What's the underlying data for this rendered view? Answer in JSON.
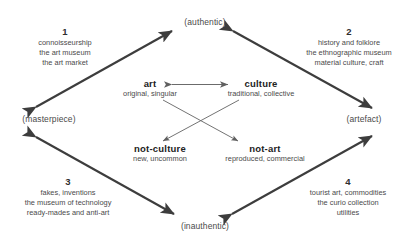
{
  "diagram": {
    "colors": {
      "outer_arrow": "#3d3d3d",
      "inner_arrow": "#6b6b6b",
      "text": "#4a4a4a",
      "heading_text": "#222222",
      "background": "#ffffff"
    },
    "poles": [
      {
        "id": "top",
        "label": "(authentic)"
      },
      {
        "id": "left",
        "label": "(masterpiece)"
      },
      {
        "id": "right",
        "label": "(artefact)"
      },
      {
        "id": "bottom",
        "label": "(inauthentic)"
      }
    ],
    "quadrants": [
      {
        "id": "q1",
        "number": "1",
        "lines": [
          "connoisseurship",
          "the art museum",
          "the art market"
        ]
      },
      {
        "id": "q2",
        "number": "2",
        "lines": [
          "history and folklore",
          "the ethnographic museum",
          "material culture, craft"
        ]
      },
      {
        "id": "q3",
        "number": "3",
        "lines": [
          "fakes, inventions",
          "the museum of technology",
          "ready-mades and anti-art"
        ]
      },
      {
        "id": "q4",
        "number": "4",
        "lines": [
          "tourist art, commodities",
          "the curio collection",
          "utilities"
        ]
      }
    ],
    "terms": [
      {
        "id": "art",
        "head": "art",
        "sub": "original, singular"
      },
      {
        "id": "culture",
        "head": "culture",
        "sub": "traditional, collective"
      },
      {
        "id": "not-culture",
        "head": "not-culture",
        "sub": "new, uncommon"
      },
      {
        "id": "not-art",
        "head": "not-art",
        "sub": "reproduced, commercial"
      }
    ],
    "relations": [
      {
        "id": "art-culture",
        "from": "art",
        "to": "culture",
        "style": "double-headed",
        "weight": "thin"
      },
      {
        "id": "art-not-art",
        "from": "art",
        "to": "not-art",
        "style": "single-headed",
        "weight": "thin"
      },
      {
        "id": "culture-not-culture",
        "from": "culture",
        "to": "not-culture",
        "style": "single-headed",
        "weight": "thin"
      },
      {
        "id": "masterpiece-authentic",
        "from": "(masterpiece)",
        "to": "(authentic)",
        "style": "double-headed",
        "weight": "thick"
      },
      {
        "id": "authentic-artefact",
        "from": "(authentic)",
        "to": "(artefact)",
        "style": "double-headed",
        "weight": "thick"
      },
      {
        "id": "masterpiece-inauthentic",
        "from": "(masterpiece)",
        "to": "(inauthentic)",
        "style": "double-headed",
        "weight": "thick"
      },
      {
        "id": "inauthentic-artefact",
        "from": "(inauthentic)",
        "to": "(artefact)",
        "style": "double-headed",
        "weight": "thick"
      }
    ]
  }
}
